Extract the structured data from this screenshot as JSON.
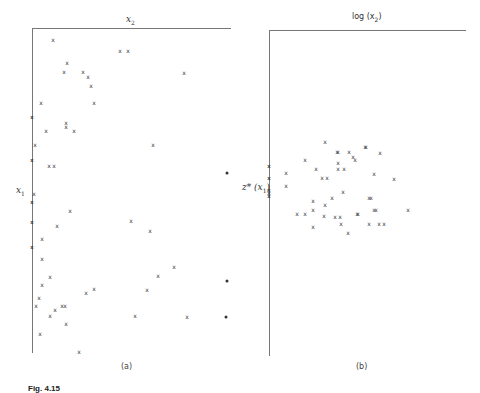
{
  "chart_data": [
    {
      "type": "scatter",
      "panel": "(a)",
      "title": "",
      "xlabel": "x2",
      "ylabel": "x1",
      "marker": "x",
      "grid": false,
      "axis_origin": {
        "x": 32,
        "y": 28
      },
      "points_px": [
        [
          53,
          40
        ],
        [
          120,
          51
        ],
        [
          128,
          51
        ],
        [
          67,
          63
        ],
        [
          64,
          72
        ],
        [
          83,
          72
        ],
        [
          88,
          77
        ],
        [
          184,
          73
        ],
        [
          91,
          86
        ],
        [
          41,
          103
        ],
        [
          94,
          103
        ],
        [
          66,
          123
        ],
        [
          66,
          127
        ],
        [
          46,
          131
        ],
        [
          74,
          131
        ],
        [
          35,
          145
        ],
        [
          153,
          145
        ],
        [
          49,
          166
        ],
        [
          54,
          166
        ],
        [
          34,
          194
        ],
        [
          70,
          211
        ],
        [
          131,
          221
        ],
        [
          57,
          226
        ],
        [
          150,
          231
        ],
        [
          42,
          239
        ],
        [
          42,
          259
        ],
        [
          50,
          277
        ],
        [
          42,
          285
        ],
        [
          174,
          267
        ],
        [
          158,
          276
        ],
        [
          39,
          298
        ],
        [
          36,
          306
        ],
        [
          55,
          310
        ],
        [
          86,
          293
        ],
        [
          94,
          289
        ],
        [
          147,
          290
        ],
        [
          62,
          306
        ],
        [
          65,
          306
        ],
        [
          50,
          316
        ],
        [
          135,
          316
        ],
        [
          187,
          317
        ],
        [
          66,
          324
        ],
        [
          40,
          334
        ],
        [
          79,
          352
        ]
      ],
      "axis_ticks_px": [
        117,
        160,
        202,
        222,
        247
      ],
      "edge_dots_px": [
        [
          227,
          173
        ],
        [
          227,
          281
        ],
        [
          226,
          317
        ]
      ]
    },
    {
      "type": "scatter",
      "panel": "(b)",
      "title": "",
      "xlabel": "log (x2)",
      "ylabel": "z*(x1)",
      "marker": "x",
      "grid": false,
      "axis_origin": {
        "x": 269,
        "y": 30
      },
      "points_px": [
        [
          325,
          142
        ],
        [
          337,
          152
        ],
        [
          338,
          152
        ],
        [
          365,
          147
        ],
        [
          366,
          147
        ],
        [
          380,
          153
        ],
        [
          305,
          160
        ],
        [
          349,
          152
        ],
        [
          353,
          157
        ],
        [
          355,
          160
        ],
        [
          338,
          163
        ],
        [
          338,
          169
        ],
        [
          344,
          169
        ],
        [
          286,
          173
        ],
        [
          316,
          169
        ],
        [
          322,
          178
        ],
        [
          327,
          178
        ],
        [
          374,
          174
        ],
        [
          394,
          179
        ],
        [
          286,
          186
        ],
        [
          343,
          192
        ],
        [
          332,
          198
        ],
        [
          369,
          198
        ],
        [
          371,
          198
        ],
        [
          313,
          201
        ],
        [
          325,
          205
        ],
        [
          313,
          210
        ],
        [
          374,
          210
        ],
        [
          376,
          210
        ],
        [
          408,
          210
        ],
        [
          297,
          214
        ],
        [
          305,
          214
        ],
        [
          324,
          216
        ],
        [
          335,
          217
        ],
        [
          340,
          217
        ],
        [
          357,
          214
        ],
        [
          358,
          214
        ],
        [
          341,
          224
        ],
        [
          369,
          224
        ],
        [
          379,
          224
        ],
        [
          384,
          224
        ],
        [
          313,
          227
        ],
        [
          348,
          233
        ]
      ],
      "axis_ticks_px": [
        166,
        178,
        190,
        193,
        196
      ]
    }
  ],
  "panels": {
    "a": {
      "x_label": "x",
      "x_sub": "2",
      "y_label": "x",
      "y_sub": "1",
      "sub_label": "(a)"
    },
    "b": {
      "x_label_pre": "log (x",
      "x_sub": "2",
      "x_label_post": ")",
      "y_label_pre": "z* (x",
      "y_sub": "1",
      "y_label_post": ")",
      "sub_label": "(b)"
    }
  },
  "caption": "Fig. 4.15"
}
